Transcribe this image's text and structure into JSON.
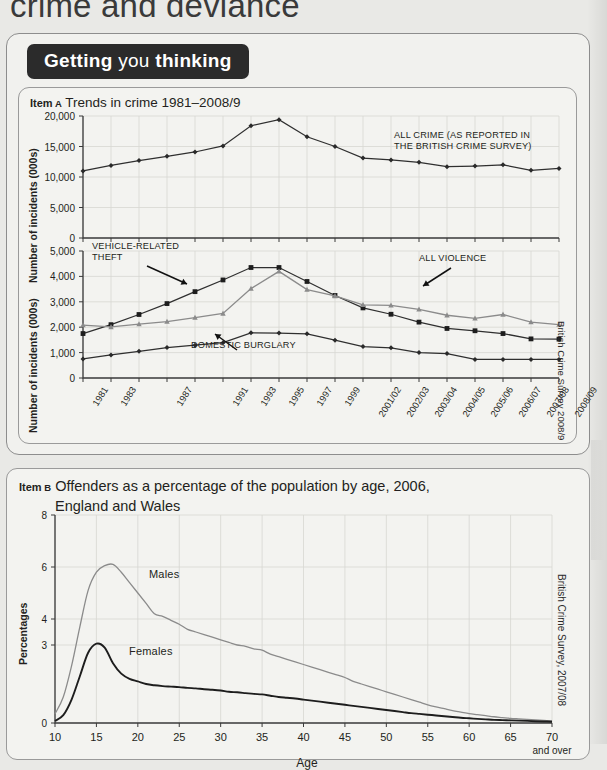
{
  "page": {
    "chapter_title": "crime and deviance",
    "banner": {
      "word1": "Getting",
      "word2": "you",
      "word3": "thinking"
    }
  },
  "item_a": {
    "tag": "Item A",
    "title": "Trends in crime 1981–2008/9",
    "source": "British Crime Survey 2008/9",
    "ylabel_top": "Number of incidents (000s)",
    "ylabel_bottom": "Number of incidents (000s)",
    "annotation_all_crime": "ALL CRIME (AS REPORTED IN\nTHE BRITISH CRIME SURVEY)",
    "annotation_vehicle": "VEHICLE-RELATED\nTHEFT",
    "annotation_burglary": "DOMESTIC BURGLARY",
    "annotation_violence": "ALL VIOLENCE"
  },
  "item_b": {
    "tag": "Item B",
    "title_line1": "Offenders as a percentage of the population by age, 2006,",
    "title_line2": "England and Wales",
    "source": "British Crime Survey, 2007/08",
    "ylabel": "Percentages",
    "xlabel": "Age",
    "label_males": "Males",
    "label_females": "Females",
    "last_tick_note": "and over"
  },
  "chart_data": [
    {
      "id": "item-a-top",
      "type": "line",
      "title": "Trends in crime 1981–2008/9 — all crime",
      "xlabel": "",
      "ylabel": "Number of incidents (000s)",
      "ylim": [
        0,
        20000
      ],
      "yticks": [
        0,
        5000,
        10000,
        15000,
        20000
      ],
      "ytick_labels": [
        "0",
        "5,000",
        "10,000",
        "15,000",
        "20,000"
      ],
      "grid": true,
      "legend": "none",
      "categories": [
        "1981",
        "1983",
        "1985",
        "1987",
        "1989",
        "1991",
        "1993",
        "1995",
        "1997",
        "1999",
        "2001/02",
        "2002/03",
        "2003/04",
        "2004/05",
        "2005/06",
        "2006/07",
        "2007/08",
        "2008/09"
      ],
      "series": [
        {
          "name": "ALL CRIME (AS REPORTED IN THE BRITISH CRIME SURVEY)",
          "marker": "diamond",
          "color": "#2f2f2f",
          "values": [
            11000,
            11900,
            12700,
            13400,
            14100,
            15100,
            18400,
            19400,
            16600,
            15000,
            13100,
            12800,
            12400,
            11700,
            11800,
            12000,
            11100,
            11400
          ]
        }
      ]
    },
    {
      "id": "item-a-bottom",
      "type": "line",
      "title": "Trends in crime 1981–2008/9 — offence groups",
      "xlabel": "",
      "ylabel": "Number of incidents (000s)",
      "ylim": [
        0,
        5000
      ],
      "yticks": [
        0,
        1000,
        2000,
        3000,
        4000,
        5000
      ],
      "ytick_labels": [
        "0",
        "1,000",
        "2,000",
        "3,000",
        "4,000",
        "5,000"
      ],
      "grid": true,
      "legend": "annotations",
      "categories": [
        "1981",
        "1983",
        "1985",
        "1987",
        "1989",
        "1991",
        "1993",
        "1995",
        "1997",
        "1999",
        "2001/02",
        "2002/03",
        "2003/04",
        "2004/05",
        "2005/06",
        "2006/07",
        "2007/08",
        "2008/09"
      ],
      "series": [
        {
          "name": "VEHICLE-RELATED THEFT",
          "marker": "square",
          "color": "#1d1d1d",
          "values": [
            1750,
            2100,
            2500,
            2930,
            3400,
            3860,
            4350,
            4350,
            3800,
            3250,
            2760,
            2510,
            2200,
            1950,
            1860,
            1750,
            1540,
            1530
          ]
        },
        {
          "name": "ALL VIOLENCE",
          "marker": "triangle",
          "color": "#8b8b8b",
          "values": [
            2080,
            2010,
            2120,
            2220,
            2380,
            2540,
            3520,
            4200,
            3480,
            3230,
            2880,
            2860,
            2700,
            2470,
            2350,
            2500,
            2200,
            2100
          ]
        },
        {
          "name": "DOMESTIC BURGLARY",
          "marker": "diamond",
          "color": "#2f2f2f",
          "values": [
            750,
            910,
            1050,
            1200,
            1290,
            1390,
            1780,
            1770,
            1740,
            1490,
            1240,
            1190,
            1000,
            960,
            730,
            730,
            730,
            730
          ]
        }
      ]
    },
    {
      "id": "item-b",
      "type": "line",
      "title": "Offenders as a percentage of the population by age, 2006, England and Wales",
      "xlabel": "Age",
      "ylabel": "Percentages",
      "ylim": [
        0,
        8
      ],
      "yticks": [
        0,
        3,
        4,
        6,
        8
      ],
      "ytick_labels": [
        "0",
        "3",
        "4",
        "6",
        "8"
      ],
      "xticks": [
        10,
        15,
        20,
        25,
        30,
        35,
        40,
        45,
        50,
        55,
        60,
        65,
        70
      ],
      "xtick_labels": [
        "10",
        "15",
        "20",
        "25",
        "30",
        "35",
        "40",
        "45",
        "50",
        "55",
        "60",
        "65",
        "70"
      ],
      "grid": true,
      "x": [
        10,
        11,
        12,
        13,
        14,
        15,
        16,
        17,
        18,
        19,
        20,
        21,
        22,
        23,
        24,
        25,
        26,
        27,
        28,
        29,
        30,
        31,
        32,
        33,
        34,
        35,
        36,
        37,
        38,
        39,
        40,
        41,
        42,
        43,
        44,
        45,
        46,
        47,
        48,
        49,
        50,
        51,
        52,
        53,
        54,
        55,
        56,
        57,
        58,
        59,
        60,
        61,
        62,
        63,
        64,
        65,
        66,
        67,
        68,
        69,
        70
      ],
      "series": [
        {
          "name": "Males",
          "color": "#8b8b8b",
          "values": [
            0.35,
            1.0,
            2.2,
            3.7,
            5.1,
            5.8,
            6.05,
            6.1,
            5.8,
            5.4,
            5.0,
            4.6,
            4.2,
            4.1,
            3.95,
            3.8,
            3.6,
            3.5,
            3.4,
            3.3,
            3.2,
            3.1,
            3.0,
            2.95,
            2.85,
            2.8,
            2.65,
            2.55,
            2.45,
            2.35,
            2.25,
            2.15,
            2.05,
            1.95,
            1.85,
            1.75,
            1.6,
            1.5,
            1.4,
            1.3,
            1.2,
            1.1,
            1.0,
            0.9,
            0.8,
            0.7,
            0.62,
            0.55,
            0.48,
            0.42,
            0.36,
            0.32,
            0.28,
            0.24,
            0.21,
            0.18,
            0.16,
            0.14,
            0.12,
            0.1,
            0.08
          ]
        },
        {
          "name": "Females",
          "color": "#1d1d1d",
          "values": [
            0.08,
            0.3,
            0.9,
            1.8,
            2.7,
            3.05,
            2.9,
            2.3,
            1.9,
            1.7,
            1.6,
            1.5,
            1.45,
            1.42,
            1.4,
            1.38,
            1.35,
            1.33,
            1.3,
            1.28,
            1.25,
            1.2,
            1.18,
            1.15,
            1.12,
            1.1,
            1.05,
            1.0,
            0.97,
            0.94,
            0.9,
            0.86,
            0.82,
            0.78,
            0.74,
            0.7,
            0.66,
            0.62,
            0.58,
            0.54,
            0.5,
            0.46,
            0.42,
            0.38,
            0.35,
            0.32,
            0.29,
            0.26,
            0.23,
            0.2,
            0.18,
            0.16,
            0.14,
            0.12,
            0.11,
            0.1,
            0.09,
            0.08,
            0.07,
            0.06,
            0.05
          ]
        }
      ]
    }
  ]
}
